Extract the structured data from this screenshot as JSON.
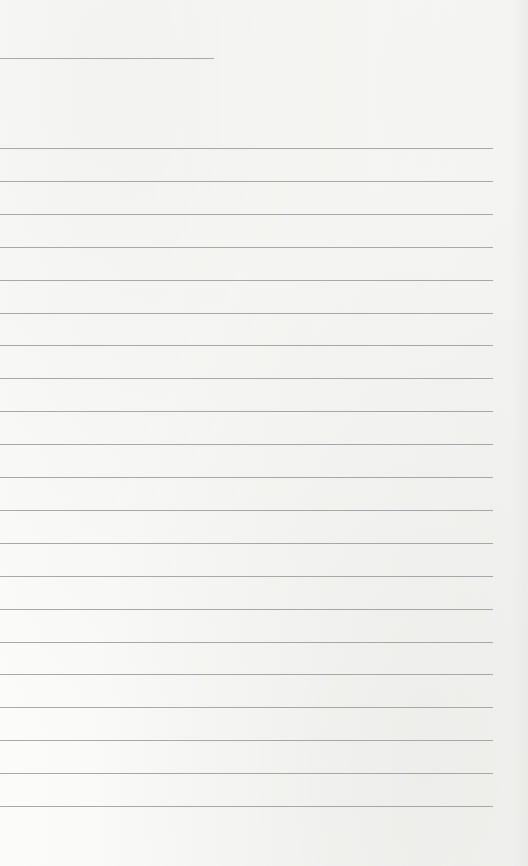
{
  "page": {
    "type": "lined-paper",
    "background_color": "#fbfbfa",
    "line_color": "#9a9a9a"
  },
  "header_line": {
    "x": 0,
    "y": 58,
    "width": 214
  },
  "ruled_lines": {
    "start_y": 148,
    "spacing": 32.9,
    "count": 21,
    "x": 0,
    "width": 493
  }
}
